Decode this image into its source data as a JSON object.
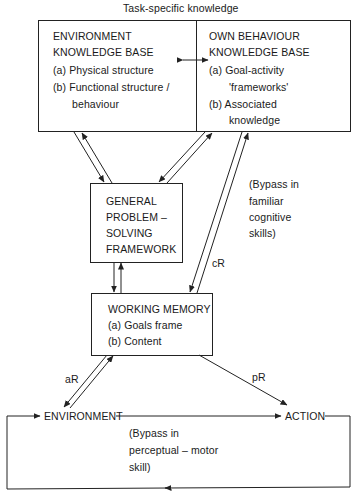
{
  "title": "Task-specific knowledge",
  "environment_kb": {
    "title_line1": "ENVIRONMENT",
    "title_line2": "KNOWLEDGE BASE",
    "item_a": "(a)  Physical structure",
    "item_b_line1": "(b) Functional structure /",
    "item_b_line2": "behaviour"
  },
  "behaviour_kb": {
    "title_line1": "OWN BEHAVIOUR",
    "title_line2": "KNOWLEDGE BASE",
    "item_a_line1": "(a)  Goal-activity",
    "item_a_line2": "'frameworks'",
    "item_b_line1": "(b) Associated",
    "item_b_line2": "knowledge"
  },
  "gps": {
    "line1": "GENERAL",
    "line2": "PROBLEM –",
    "line3": "SOLVING",
    "line4": "FRAMEWORK"
  },
  "working_memory": {
    "title": "WORKING MEMORY",
    "item_a": "(a) Goals frame",
    "item_b": "(b) Content"
  },
  "bypass_cognitive": {
    "line1": "(Bypass in",
    "line2": "familiar",
    "line3": "cognitive",
    "line4": "skills)"
  },
  "bypass_perceptual": {
    "line1": "(Bypass in",
    "line2": "perceptual – motor",
    "line3": "skill)"
  },
  "labels": {
    "cR": "cR",
    "aR": "aR",
    "pR": "pR",
    "environment": "ENVIRONMENT",
    "action": "ACTION"
  }
}
